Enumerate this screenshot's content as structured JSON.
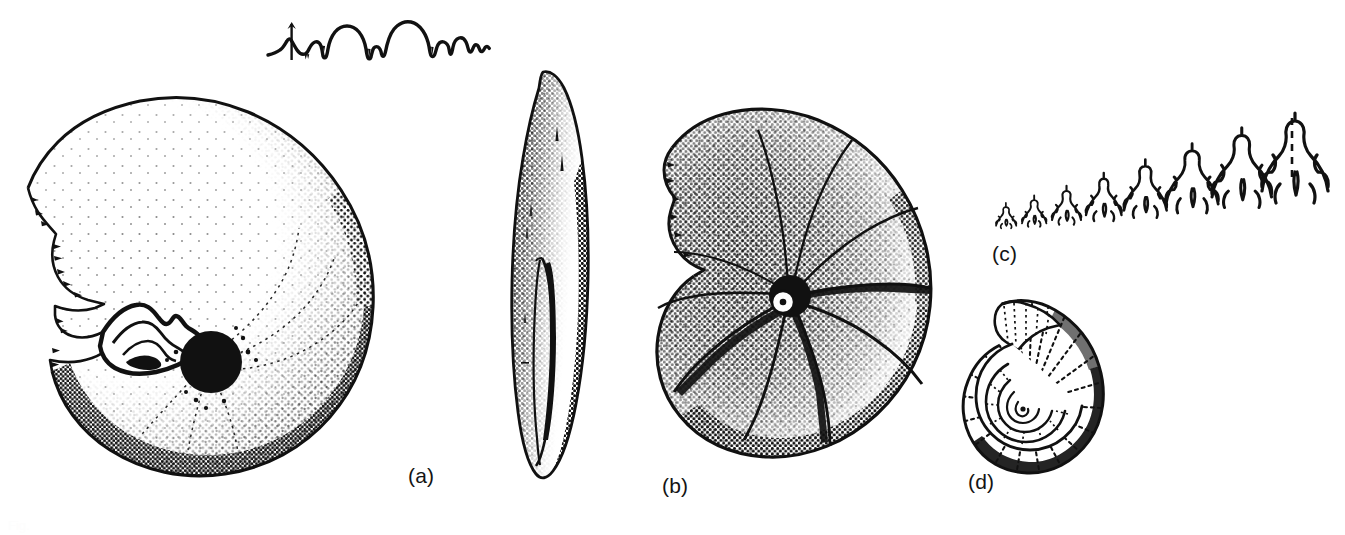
{
  "plate": {
    "kind": "scientific-illustration",
    "subject": "ammonite fossil plate",
    "background_color": "#ffffff",
    "ink_color": "#111111",
    "width": 1345,
    "height": 535
  },
  "panels": [
    {
      "id": "a",
      "label": "(a)",
      "label_x": 408,
      "label_y": 474,
      "figure_name": "lateral-view-ammonite",
      "description": "large discoidal ammonite shell, lateral view, stippled shading, exposed inner whorl and dark umbilical plug"
    },
    {
      "id": "b",
      "label": "(b)",
      "label_x": 662,
      "label_y": 474,
      "figure_name": "ribbed-ammonite-lateral",
      "description": "globose ribbed ammonite, lateral view with radial ribs and heavy stipple on venter"
    },
    {
      "id": "c",
      "label": "(c)",
      "label_x": 992,
      "label_y": 246,
      "figure_name": "ammonitic-suture-line",
      "description": "complex frilled ammonitic suture line with repeated lobes and saddles, dashed siphuncle marker at right"
    },
    {
      "id": "d",
      "label": "(d)",
      "label_x": 968,
      "label_y": 474,
      "figure_name": "small-ribbed-ammonite",
      "description": "small coiled ammonite with prominent radial ribs and visible inner spiral whorls"
    }
  ],
  "unlabeled_figures": [
    {
      "figure_name": "goniatitic-suture-trace",
      "description": "simple suture line trace above panel (a) showing rounded saddles and pointed lobes",
      "x": 272,
      "y": 18
    },
    {
      "figure_name": "ventral-view-ammonite",
      "description": "narrow elongate apertural / ventral view of the panel (a) specimen, lens shaped",
      "x": 500,
      "y": 65
    }
  ],
  "ghost_caption": "Fig."
}
